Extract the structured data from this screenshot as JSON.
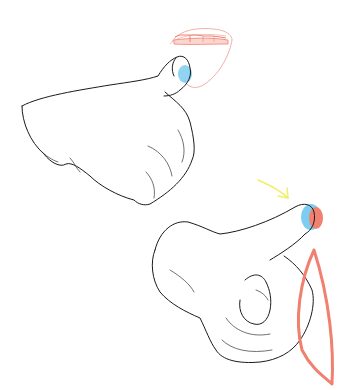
{
  "illustration": {
    "description": "Two sketches of a hand with pointing index finger; upper one touching mouth/teeth, lower one with arrow toward fingertip",
    "colors": {
      "line": "#1a1a1a",
      "fingertip_highlight": "#7ccdf0",
      "accent_red": "#f08070",
      "mouth_outline": "#f3b0a8",
      "arrow": "#f2ee6a",
      "background": "#ffffff"
    },
    "annotations": {
      "top_hand": "hand with index finger pressing into mouth",
      "bottom_hand": "pointing hand with arrow and red leaf-shaped contour guide"
    }
  }
}
